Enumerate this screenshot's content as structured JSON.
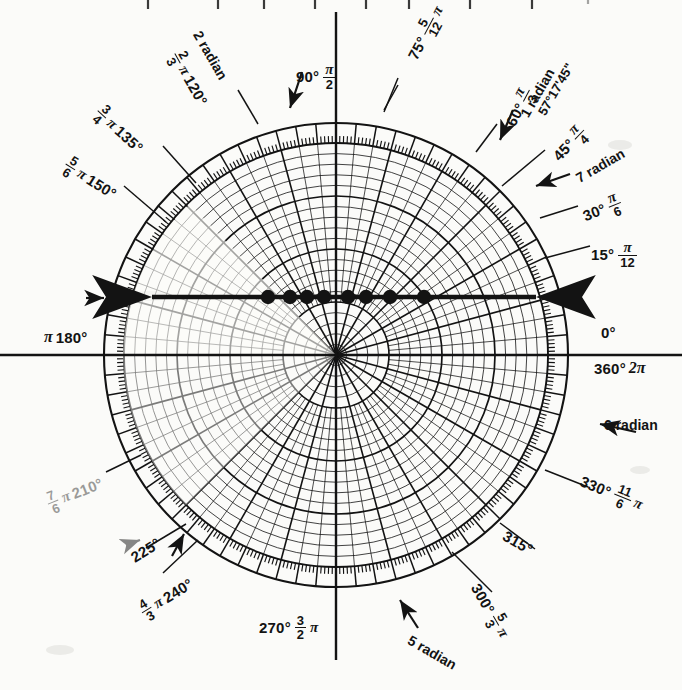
{
  "figure": {
    "kind": "polar-coordinate-graph-paper",
    "background_color": "#fbfbf9",
    "ink_color": "#131313"
  },
  "chart_data": {
    "type": "scatter",
    "title": "",
    "subtitle": "",
    "coordinate_system": "polar",
    "xlabel": "",
    "ylabel": "",
    "grid": true,
    "legend_position": "none",
    "center": {
      "x": 336,
      "y": 355
    },
    "outer_radius": 232,
    "inner_scale_radius": 212,
    "angle_unit_labels": [
      "degrees",
      "radians"
    ],
    "radial_rings": 20,
    "radial_ring_emphasis_every": 5,
    "radial_spokes_minor_degrees": 5,
    "radial_spokes_major_degrees": 15,
    "tick_ring_degrees": 1,
    "axis_labels": [
      {
        "angle_deg": 0,
        "degrees": "0°",
        "degrees_alt": "360°",
        "radian": "2π",
        "radian_fraction": null
      },
      {
        "angle_deg": 15,
        "degrees": "15°",
        "radian": "π",
        "radian_fraction": {
          "num": "π",
          "den": "12"
        }
      },
      {
        "angle_deg": 30,
        "degrees": "30°",
        "radian": "π",
        "radian_fraction": {
          "num": "π",
          "den": "6"
        }
      },
      {
        "angle_deg": 45,
        "degrees": "45°",
        "radian": "π",
        "radian_fraction": {
          "num": "π",
          "den": "4"
        }
      },
      {
        "angle_deg": 60,
        "degrees": "60°",
        "radian": "π",
        "radian_fraction": {
          "num": "π",
          "den": "3"
        }
      },
      {
        "angle_deg": 75,
        "degrees": "75°",
        "radian": "π",
        "radian_fraction": {
          "num": "5",
          "den": "12"
        }
      },
      {
        "angle_deg": 90,
        "degrees": "90°",
        "radian": "π",
        "radian_fraction": {
          "num": "π",
          "den": "2"
        }
      },
      {
        "angle_deg": 120,
        "degrees": "120°",
        "radian": "π",
        "radian_fraction": {
          "num": "2",
          "den": "3"
        }
      },
      {
        "angle_deg": 135,
        "degrees": "135°",
        "radian": "π",
        "radian_fraction": {
          "num": "3",
          "den": "4"
        }
      },
      {
        "angle_deg": 150,
        "degrees": "150°",
        "radian": "π",
        "radian_fraction": {
          "num": "5",
          "den": "6"
        }
      },
      {
        "angle_deg": 180,
        "degrees": "180°",
        "radian": "π",
        "radian_fraction": null
      },
      {
        "angle_deg": 210,
        "degrees": "210°",
        "radian": "π",
        "radian_fraction": {
          "num": "7",
          "den": "6"
        }
      },
      {
        "angle_deg": 225,
        "degrees": "225°",
        "radian": "π",
        "radian_fraction": null
      },
      {
        "angle_deg": 240,
        "degrees": "240°",
        "radian": "π",
        "radian_fraction": {
          "num": "4",
          "den": "3"
        }
      },
      {
        "angle_deg": 270,
        "degrees": "270°",
        "radian": "π",
        "radian_fraction": {
          "num": "3",
          "den": "2"
        }
      },
      {
        "angle_deg": 300,
        "degrees": "300°",
        "radian": "π",
        "radian_fraction": {
          "num": "5",
          "den": "3"
        }
      },
      {
        "angle_deg": 315,
        "degrees": "315°",
        "radian": null,
        "radian_fraction": null
      },
      {
        "angle_deg": 330,
        "degrees": "330°",
        "radian": "π",
        "radian_fraction": {
          "num": "11",
          "den": "6"
        }
      }
    ],
    "radian_markers": [
      {
        "label": "1 radian",
        "value": 1,
        "degrees_equivalent": "57°17'45\""
      },
      {
        "label": "2 radian",
        "value": 2
      },
      {
        "label": "5 radian",
        "value": 5
      },
      {
        "label": "6 radian",
        "value": 6
      },
      {
        "label": "7 radian",
        "value": 7
      }
    ],
    "series": [
      {
        "name": "plotted points on 0-180 axis",
        "marker": "filled-circle",
        "marker_color": "#131313",
        "angle_deg": 180,
        "points_px_x": [
          268,
          290,
          307,
          324,
          348,
          366,
          390,
          424
        ],
        "points_y_px": 297,
        "count": 8
      }
    ],
    "annotations": [
      {
        "kind": "double-arrow-line",
        "y_px": 297,
        "x_start_px": 148,
        "x_end_px": 540,
        "note": "thick horizontal line with arrowheads at both ends"
      },
      {
        "kind": "arrow-marker",
        "target": "120°",
        "note": "arrow pointing to 120 degree spoke"
      },
      {
        "kind": "arrow-marker",
        "target": "60°",
        "note": "arrow pointing to 60 degree spoke"
      },
      {
        "kind": "arrow-marker",
        "target": "45°",
        "note": "arrow pointing to 45 degree spoke"
      },
      {
        "kind": "arrow-marker",
        "target": "225°",
        "note": "arrow pointing to 225 degree spoke"
      },
      {
        "kind": "arrow-marker",
        "target": "180°",
        "note": "small arrow left of rim at 180 degrees"
      }
    ]
  },
  "labels": {
    "deg_0": "0°",
    "deg_360": "360°",
    "rad_2pi": "2π",
    "deg_15": "15°",
    "deg_30": "30°",
    "deg_45": "45°",
    "deg_60": "60°",
    "deg_75": "75°",
    "deg_90": "90°",
    "deg_120": "120°",
    "deg_135": "135°",
    "deg_150": "150°",
    "deg_180": "180°",
    "deg_210": "210°",
    "deg_225": "225°",
    "deg_240": "240°",
    "deg_270": "270°",
    "deg_300": "300°",
    "deg_315": "315°",
    "deg_330": "330°",
    "pi": "π",
    "radian_1": "1 radian",
    "radian_2": "2 radian",
    "radian_5": "5 radian",
    "radian_6": "6 radian",
    "radian_7": "7 radian",
    "deg_min_sec_1rad": "57°17'45\"",
    "f_12_num": "π",
    "f_12_den": "12",
    "f_6_num": "π",
    "f_6_den": "6",
    "f_4_num": "π",
    "f_4_den": "4",
    "f_3_num": "π",
    "f_3_den": "3",
    "f_2_num": "π",
    "f_2_den": "2",
    "f_512_num": "5",
    "f_512_den": "12",
    "f_23_num": "2",
    "f_23_den": "3",
    "f_34_num": "3",
    "f_34_den": "4",
    "f_56_num": "5",
    "f_56_den": "6",
    "f_76_num": "7",
    "f_76_den": "6",
    "f_43_num": "4",
    "f_43_den": "3",
    "f_32_num": "3",
    "f_32_den": "2",
    "f_53_num": "5",
    "f_53_den": "3",
    "f_116_num": "11",
    "f_116_den": "6"
  }
}
